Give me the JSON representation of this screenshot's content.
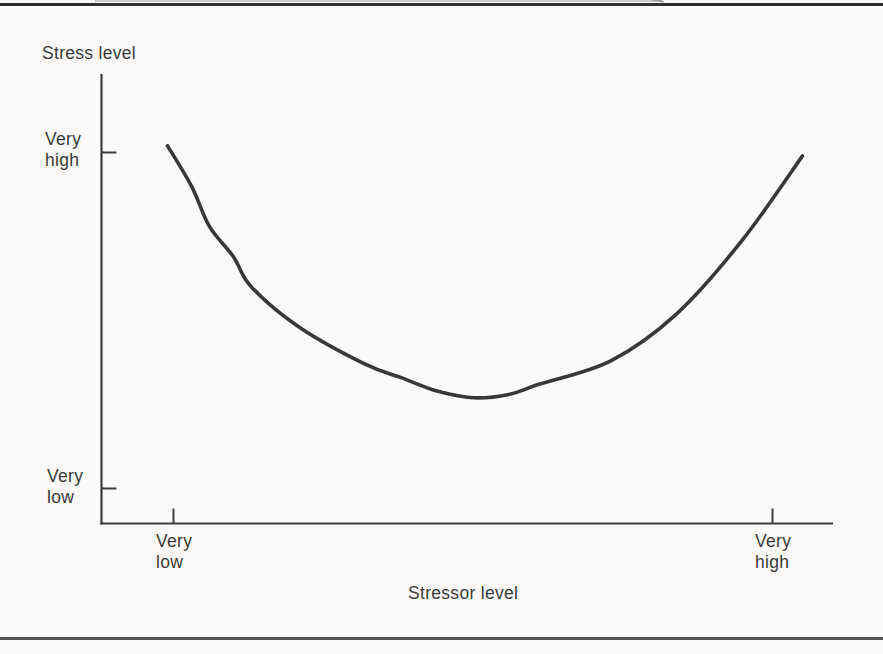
{
  "chart_data": {
    "type": "line",
    "title": "",
    "ylabel": "Stress level",
    "xlabel": "Stressor level",
    "x_tick_labels": [
      "Very low",
      "Very high"
    ],
    "y_tick_labels": [
      "Very high",
      "Very low"
    ],
    "x_axis_type": "qualitative",
    "y_axis_type": "qualitative",
    "grid": "off",
    "legend": "none",
    "series": [
      {
        "name": "stress-vs-stressor-curve",
        "color": "#383838",
        "points": [
          {
            "x": -0.01,
            "y": 1.02
          },
          {
            "x": 0.03,
            "y": 0.9
          },
          {
            "x": 0.06,
            "y": 0.78
          },
          {
            "x": 0.1,
            "y": 0.69
          },
          {
            "x": 0.13,
            "y": 0.6
          },
          {
            "x": 0.21,
            "y": 0.48
          },
          {
            "x": 0.32,
            "y": 0.37
          },
          {
            "x": 0.38,
            "y": 0.33
          },
          {
            "x": 0.44,
            "y": 0.29
          },
          {
            "x": 0.5,
            "y": 0.27
          },
          {
            "x": 0.56,
            "y": 0.28
          },
          {
            "x": 0.61,
            "y": 0.31
          },
          {
            "x": 0.73,
            "y": 0.38
          },
          {
            "x": 0.84,
            "y": 0.52
          },
          {
            "x": 0.95,
            "y": 0.74
          },
          {
            "x": 1.05,
            "y": 0.99
          }
        ]
      }
    ]
  },
  "labels": {
    "y_axis_title": "Stress level",
    "x_axis_title": "Stressor level",
    "y_tick_high": {
      "line1": "Very",
      "line2": "high"
    },
    "y_tick_low": {
      "line1": "Very",
      "line2": "low"
    },
    "x_tick_low": {
      "line1": "Very",
      "line2": "low"
    },
    "x_tick_high": {
      "line1": "Very",
      "line2": "high"
    }
  },
  "colors": {
    "paper": "#fbfaf8",
    "ink": "#3a3a3a",
    "axis": "#3c3c3c",
    "curve": "#383838",
    "top_rule": "#303030",
    "bottom_rule": "#555555"
  }
}
